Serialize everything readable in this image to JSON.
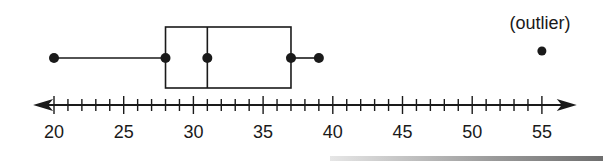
{
  "chart_data": {
    "type": "boxplot",
    "title": "",
    "xlabel": "",
    "ylabel": "",
    "orientation": "horizontal",
    "axis": {
      "min": 20,
      "max": 55,
      "major_step": 5,
      "minor_step": 1,
      "tick_labels": [
        "20",
        "25",
        "30",
        "35",
        "40",
        "45",
        "50",
        "55"
      ],
      "arrows": "both",
      "range_shown": [
        18.5,
        57.5
      ]
    },
    "box": {
      "min": 20,
      "q1": 28,
      "median": 31,
      "q3": 37,
      "max": 39
    },
    "outliers": [
      55
    ],
    "annotations": [
      {
        "text": "(outlier)",
        "x": 55
      }
    ],
    "grid": false,
    "legend": null
  },
  "colors": {
    "ink": "#1a1a1a",
    "background": "#ffffff"
  }
}
